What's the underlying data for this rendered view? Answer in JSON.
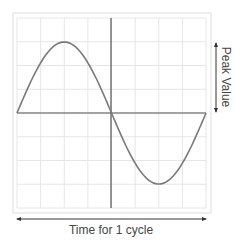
{
  "chart_data": {
    "type": "line",
    "title": "",
    "xlabel": "Time for 1 cycle",
    "ylabel": "Peak Value",
    "grid": true,
    "grid_divisions": {
      "x": 8,
      "y": 8
    },
    "series": [
      {
        "name": "sine wave",
        "x": [
          0,
          0.125,
          0.25,
          0.375,
          0.5,
          0.625,
          0.75,
          0.875,
          1.0
        ],
        "y": [
          0,
          0.707,
          1,
          0.707,
          0,
          -0.707,
          -1,
          -0.707,
          0
        ]
      }
    ],
    "peak_value": 1,
    "colors": {
      "wave": "#7a7a7a",
      "axes": "#555555",
      "grid": "#e6e6e6",
      "border": "#e0e0e0"
    }
  },
  "labels": {
    "x_arrow_label": "Time for 1 cycle",
    "y_arrow_label": "Peak Value"
  }
}
